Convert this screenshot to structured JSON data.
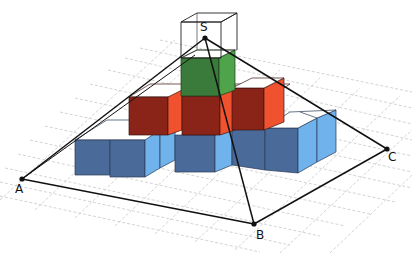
{
  "diagram": {
    "type": "3d-geometry-figure",
    "vertices": [
      {
        "id": "S",
        "label": "S",
        "x": 205,
        "y": 38
      },
      {
        "id": "A",
        "label": "A",
        "x": 22,
        "y": 179
      },
      {
        "id": "B",
        "label": "B",
        "x": 254,
        "y": 224
      },
      {
        "id": "C",
        "label": "C",
        "x": 387,
        "y": 149
      }
    ],
    "edges": [
      [
        "S",
        "A"
      ],
      [
        "S",
        "B"
      ],
      [
        "S",
        "C"
      ],
      [
        "A",
        "B"
      ],
      [
        "B",
        "C"
      ]
    ],
    "colors": {
      "grid": "#c8c8c8",
      "blue_front": "#4a6a9a",
      "blue_side": "#6fb2ec",
      "red_front": "#8a2318",
      "red_side": "#f0522f",
      "green_front": "#3a7a3a",
      "green_side": "#4fa34a",
      "top_face": "#ffffff",
      "edge": "#111111"
    },
    "layers": [
      {
        "name": "bottom",
        "color": "blue"
      },
      {
        "name": "middle",
        "color": "red"
      },
      {
        "name": "top",
        "color": "green"
      },
      {
        "name": "wireframe",
        "color": "none"
      }
    ]
  }
}
